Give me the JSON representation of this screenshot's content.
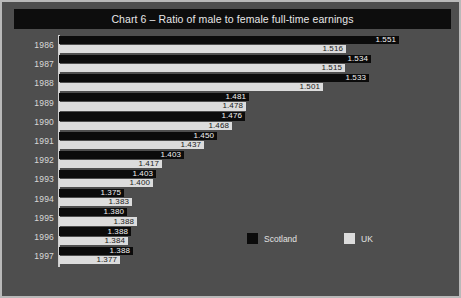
{
  "chart_data": {
    "type": "bar",
    "orientation": "horizontal",
    "title": "Chart 6 – Ratio of male to female full-time earnings",
    "xlabel": "",
    "ylabel": "",
    "grid": false,
    "legend_position": "bottom-right",
    "categories": [
      "1986",
      "1987",
      "1988",
      "1989",
      "1990",
      "1991",
      "1992",
      "1993",
      "1994",
      "1995",
      "1996",
      "1997"
    ],
    "series": [
      {
        "name": "Scotland",
        "color": "#0b0b0b",
        "values": [
          1.551,
          1.534,
          1.533,
          1.481,
          1.476,
          1.45,
          1.403,
          1.403,
          1.375,
          1.38,
          1.388,
          1.388
        ],
        "labels": [
          "1.551",
          "1.534",
          "1.533",
          "1.481",
          "1.476",
          "1.450",
          "1.403",
          "1.403",
          "1.375",
          "1.380",
          "1.388",
          "1.388"
        ]
      },
      {
        "name": "UK",
        "color": "#dcdcdc",
        "values": [
          1.516,
          1.515,
          1.501,
          1.478,
          1.468,
          1.437,
          1.417,
          1.4,
          1.383,
          1.388,
          1.384,
          1.377
        ],
        "labels": [
          "1.516",
          "1.515",
          "1.501",
          "1.478",
          "1.468",
          "1.437",
          "1.417",
          "1.400",
          "1.383",
          "1.388",
          "1.384",
          "1.377"
        ]
      }
    ],
    "bar_pixel_lengths": {
      "Scotland": [
        340,
        312,
        310,
        190,
        186,
        158,
        125,
        97,
        65,
        68,
        72,
        74
      ],
      "UK": [
        287,
        286,
        264,
        187,
        173,
        145,
        103,
        94,
        73,
        78,
        69,
        61
      ]
    }
  },
  "legend": {
    "items": [
      {
        "label": "Scotland",
        "swatch": "dark-swatch-icon"
      },
      {
        "label": "UK",
        "swatch": "light-swatch-icon"
      }
    ]
  },
  "colors": {
    "background": "#4e4e4e",
    "frame_border": "#b9b9b9",
    "title_band": "#0d0d0d",
    "title_text": "#e8e8e8",
    "scotland": "#0b0b0b",
    "uk": "#dcdcdc",
    "axis": "#cfcfcf",
    "year_text": "#d8d8d8"
  }
}
